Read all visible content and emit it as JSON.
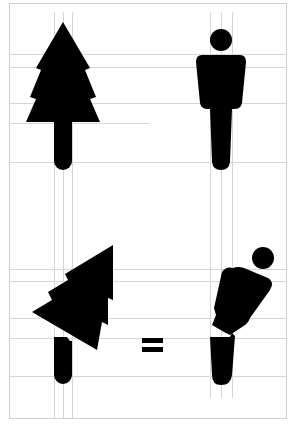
{
  "diagram": {
    "colors": {
      "background": "#ffffff",
      "figure": "#000000",
      "gridline": "#d4d4d4",
      "frame": "#cfcfcf"
    },
    "top_row": {
      "left_icon": "tree-icon",
      "right_icon": "person-icon"
    },
    "bottom_row": {
      "left_icon": "tilted-tree-icon",
      "operator": "=",
      "right_icon": "bending-person-icon"
    },
    "operator_label": "="
  }
}
